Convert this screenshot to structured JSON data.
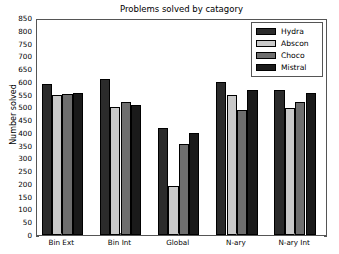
{
  "chart_data": {
    "type": "bar",
    "title": "Problems solved by catagory",
    "xlabel": "",
    "ylabel": "Number solved",
    "categories": [
      "Bin Ext",
      "Bin Int",
      "Global",
      "N-ary",
      "N-ary Int"
    ],
    "series": [
      {
        "name": "Hydra",
        "color": "#2b2b2b",
        "values": [
          590,
          610,
          418,
          601,
          568
        ]
      },
      {
        "name": "Abscon",
        "color": "#c9c9c9",
        "values": [
          550,
          500,
          192,
          549,
          496
        ]
      },
      {
        "name": "Choco",
        "color": "#6e6e6e",
        "values": [
          553,
          520,
          357,
          490,
          520
        ]
      },
      {
        "name": "Mistral",
        "color": "#1a1a1a",
        "values": [
          558,
          510,
          398,
          568,
          557
        ]
      }
    ],
    "ylim": [
      0,
      850
    ],
    "ytick_step": 50,
    "yticks": [
      0,
      50,
      100,
      150,
      200,
      250,
      300,
      350,
      400,
      450,
      500,
      550,
      600,
      650,
      700,
      750,
      800,
      850
    ],
    "grid": false,
    "legend_position": "upper right"
  }
}
